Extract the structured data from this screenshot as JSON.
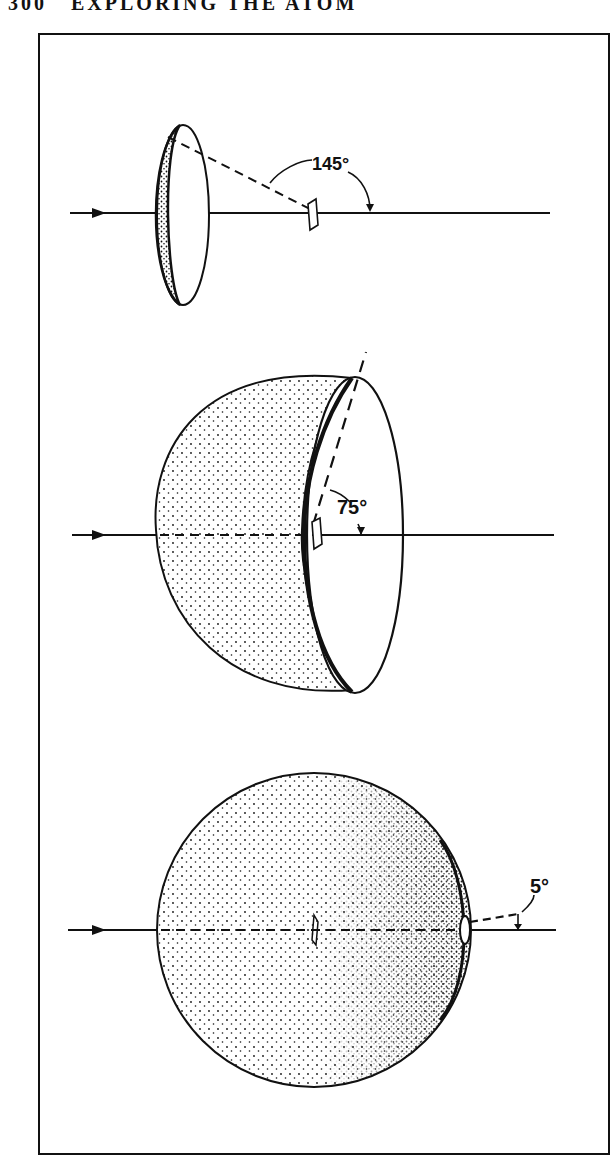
{
  "page": {
    "running_head": "300   EXPLORING THE ATOM"
  },
  "figure": {
    "panels": [
      {
        "id": "top",
        "shape": "narrow-cone-cap",
        "angle_label": "145°"
      },
      {
        "id": "middle",
        "shape": "hemisphere",
        "angle_label": "75°"
      },
      {
        "id": "bottom",
        "shape": "nearly-full-sphere",
        "angle_label": "5°"
      }
    ],
    "colors": {
      "ink": "#111111",
      "paper": "#ffffff"
    }
  }
}
